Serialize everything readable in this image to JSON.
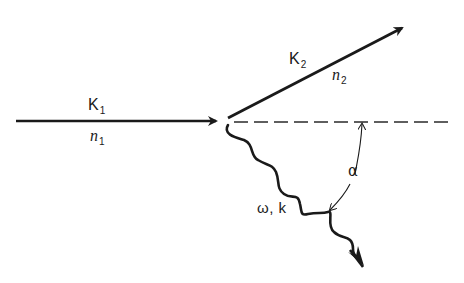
{
  "diagram": {
    "type": "wave-scattering-vector-diagram",
    "incident_wave": {
      "symbol": "K",
      "subscript": "1",
      "medium_symbol": "n",
      "medium_subscript": "1"
    },
    "scattered_wave": {
      "symbol": "K",
      "subscript": "2",
      "medium_symbol": "n",
      "medium_subscript": "2"
    },
    "emitted_wave": {
      "label": "ω, k"
    },
    "angle": {
      "label": "α"
    },
    "colors": {
      "ink": "#1a1a1a",
      "background": "#ffffff"
    }
  }
}
